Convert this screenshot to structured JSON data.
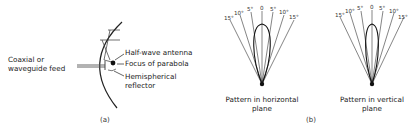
{
  "figure_a": {
    "caption": "(a)",
    "labels": {
      "feed_line1": "Coaxial or",
      "feed_line2": "waveguide feed",
      "antenna": "Half-wave antenna",
      "focus": "Focus of parabola",
      "reflector_line1": "Hemispherical",
      "reflector_line2": "reflector"
    }
  },
  "figure_b": {
    "caption": "(b)",
    "horizontal": {
      "title_line1": "Pattern in horizontal",
      "title_line2": "plane",
      "ticks": [
        "15°",
        "10°",
        "5°",
        "0",
        "5°",
        "10°",
        "15°"
      ]
    },
    "vertical": {
      "title_line1": "Pattern in vertical",
      "title_line2": "plane",
      "ticks": [
        "15°",
        "10°",
        "5°",
        "0",
        "5°",
        "10°",
        "15°"
      ]
    }
  },
  "colors": {
    "ink": "#222222",
    "background": "#ffffff"
  }
}
